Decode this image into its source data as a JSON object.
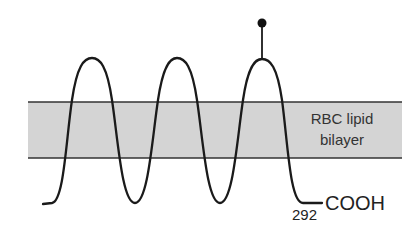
{
  "diagram": {
    "title": "",
    "membrane": {
      "label_line1": "RBC lipid",
      "label_line2": "bilayer",
      "fill_color": "#d4d4d4",
      "border_color": "#333333"
    },
    "terminus": {
      "label": "COOH",
      "residue_number": "292"
    },
    "transmembrane_segments": 6,
    "modification_marker": "glycosylation-site-dot",
    "stroke_color": "#1a1a1a"
  }
}
